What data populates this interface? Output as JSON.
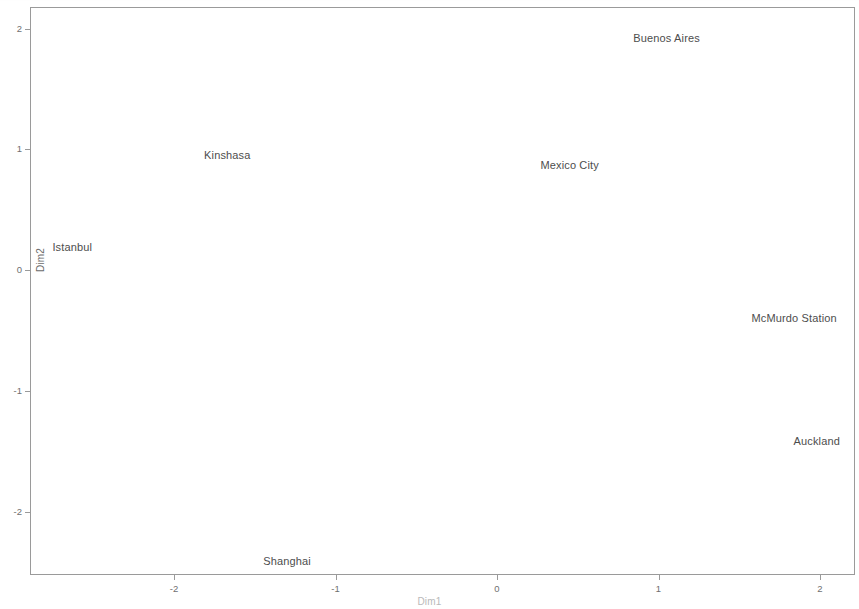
{
  "chart_data": {
    "type": "scatter",
    "title": "",
    "subtitle": "",
    "xlabel": "Dim1",
    "ylabel": "Dim2",
    "xlim": [
      -2.9,
      2.22
    ],
    "ylim": [
      -2.53,
      2.18
    ],
    "xticks": [
      "-2",
      "-1",
      "0",
      "1",
      "2"
    ],
    "xtick_values": [
      -2,
      -1,
      0,
      1,
      2
    ],
    "yticks": [
      "2",
      "1",
      "0",
      "-1",
      "-2"
    ],
    "ytick_values": [
      2,
      1,
      0,
      -1,
      -2
    ],
    "grid": false,
    "legend": false,
    "legend_position": "none",
    "marker_style": "text-label-only",
    "points": [
      {
        "label": "Buenos Aires",
        "x": 1.05,
        "y": 1.92
      },
      {
        "label": "Kinshasa",
        "x": -1.67,
        "y": 0.95
      },
      {
        "label": "Mexico City",
        "x": 0.45,
        "y": 0.87
      },
      {
        "label": "Istanbul",
        "x": -2.63,
        "y": 0.19
      },
      {
        "label": "McMurdo Station",
        "x": 1.84,
        "y": -0.4
      },
      {
        "label": "Auckland",
        "x": 1.98,
        "y": -1.42
      },
      {
        "label": "Shanghai",
        "x": -1.3,
        "y": -2.41
      }
    ],
    "colors": {
      "axis": "#9a9a9a",
      "tick_text": "#6f6f6f",
      "label_text": "#4d4d4d",
      "axis_title": "#6b6b6b",
      "background": "#ffffff"
    }
  }
}
